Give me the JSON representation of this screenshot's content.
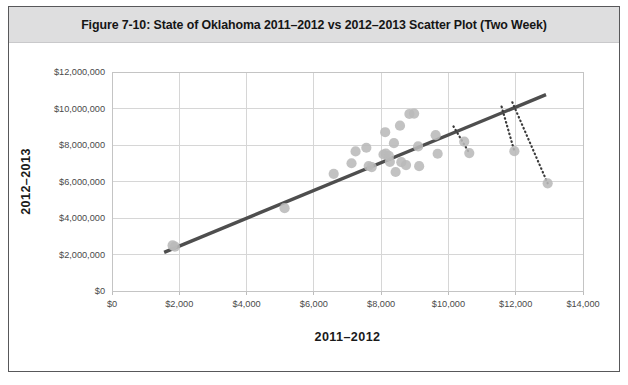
{
  "figure": {
    "title": "Figure 7-10: State of Oklahoma 2011–2012 vs 2012–2013 Scatter Plot (Two Week)"
  },
  "chart_data": {
    "type": "scatter",
    "title": "Figure 7-10: State of Oklahoma 2011–2012 vs 2012–2013 Scatter Plot (Two Week)",
    "xlabel": "2011–2012",
    "ylabel": "2012–2013",
    "xlim": [
      0,
      14000
    ],
    "ylim": [
      0,
      12000000
    ],
    "xticks": [
      0,
      2000,
      4000,
      6000,
      8000,
      10000,
      12000,
      14000
    ],
    "yticks": [
      0,
      2000000,
      4000000,
      6000000,
      8000000,
      10000000,
      12000000
    ],
    "xtick_labels": [
      "$0",
      "$2,000",
      "$4,000",
      "$6,000",
      "$8,000",
      "$10,000",
      "$12,000",
      "$14,000"
    ],
    "ytick_labels": [
      "$0",
      "$2,000,000",
      "$4,000,000",
      "$6,000,000",
      "$8,000,000",
      "$10,000,000",
      "$12,000,000"
    ],
    "grid": true,
    "legend": "none",
    "marker_color": "#b9b9b9",
    "trendline_color": "#4e4e4e",
    "leader_color": "#3a3a3a",
    "points": [
      {
        "x": 1800,
        "y": 2500000
      },
      {
        "x": 1870,
        "y": 2430000
      },
      {
        "x": 5130,
        "y": 4540000
      },
      {
        "x": 6590,
        "y": 6420000
      },
      {
        "x": 7120,
        "y": 7000000
      },
      {
        "x": 7240,
        "y": 7650000
      },
      {
        "x": 7560,
        "y": 7850000
      },
      {
        "x": 7630,
        "y": 6850000
      },
      {
        "x": 7720,
        "y": 6790000
      },
      {
        "x": 8070,
        "y": 7480000
      },
      {
        "x": 8120,
        "y": 8700000
      },
      {
        "x": 8140,
        "y": 7530000
      },
      {
        "x": 8230,
        "y": 7400000
      },
      {
        "x": 8260,
        "y": 7080000
      },
      {
        "x": 8380,
        "y": 8100000
      },
      {
        "x": 8430,
        "y": 6520000
      },
      {
        "x": 8560,
        "y": 9060000
      },
      {
        "x": 8600,
        "y": 7060000
      },
      {
        "x": 8740,
        "y": 6900000
      },
      {
        "x": 8840,
        "y": 9700000
      },
      {
        "x": 8980,
        "y": 9720000
      },
      {
        "x": 9100,
        "y": 7920000
      },
      {
        "x": 9130,
        "y": 6840000
      },
      {
        "x": 9620,
        "y": 8540000
      },
      {
        "x": 9680,
        "y": 7520000
      },
      {
        "x": 10470,
        "y": 8180000
      },
      {
        "x": 10620,
        "y": 7560000
      },
      {
        "x": 11960,
        "y": 7660000
      },
      {
        "x": 12950,
        "y": 5900000
      }
    ],
    "trendline": {
      "x0": 1550,
      "y0": 2120000,
      "x1": 12900,
      "y1": 10760000
    },
    "leader_lines": [
      {
        "x0": 10150,
        "y0": 9020000,
        "x1": 10620,
        "y1": 7560000
      },
      {
        "x0": 11580,
        "y0": 10100000,
        "x1": 11960,
        "y1": 7660000
      },
      {
        "x0": 11900,
        "y0": 10340000,
        "x1": 12950,
        "y1": 5900000
      }
    ]
  }
}
